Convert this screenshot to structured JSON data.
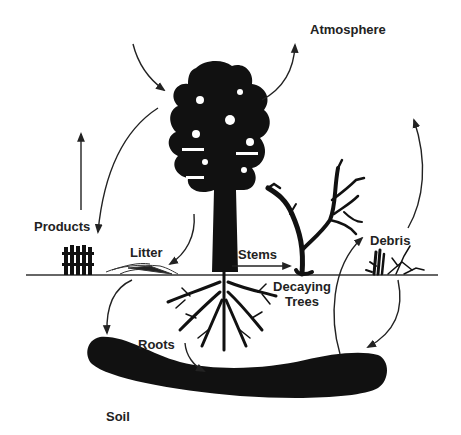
{
  "diagram": {
    "type": "carbon-cycle-illustration",
    "colors": {
      "ink": "#111111",
      "text": "#222222",
      "background": "#ffffff"
    },
    "labels": {
      "atmosphere": "Atmosphere",
      "products": "Products",
      "litter": "Litter",
      "stems": "Stems",
      "debris": "Debris",
      "decaying_trees_line1": "Decaying",
      "decaying_trees_line2": "Trees",
      "roots": "Roots",
      "soil": "Soil"
    },
    "elements": [
      {
        "name": "live-tree",
        "description": "Tall tree silhouette with root system"
      },
      {
        "name": "dead-tree",
        "description": "Bare decaying tree"
      },
      {
        "name": "fence",
        "description": "Wooden fence (wood products)"
      },
      {
        "name": "litter-pile",
        "description": "Leaf litter on ground"
      },
      {
        "name": "debris-pile",
        "description": "Woody debris on ground"
      },
      {
        "name": "soil-mass",
        "description": "Dark soil carbon pool"
      }
    ],
    "flows": [
      {
        "from": "Atmosphere",
        "to": "live-tree"
      },
      {
        "from": "live-tree",
        "to": "Atmosphere"
      },
      {
        "from": "live-tree",
        "to": "Products"
      },
      {
        "from": "Products",
        "to": "up (out)"
      },
      {
        "from": "live-tree",
        "to": "Litter"
      },
      {
        "from": "live-tree",
        "to": "Decaying Trees",
        "label": "Stems"
      },
      {
        "from": "Litter",
        "to": "Soil"
      },
      {
        "from": "Roots",
        "to": "Soil"
      },
      {
        "from": "Soil",
        "to": "Debris"
      },
      {
        "from": "Debris",
        "to": "Soil"
      },
      {
        "from": "Debris",
        "to": "up (atmosphere)"
      }
    ]
  }
}
